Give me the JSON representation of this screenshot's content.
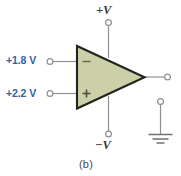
{
  "figure": {
    "caption": "(b)",
    "background_color": "#ffffff"
  },
  "colors": {
    "wire": "#8e9096",
    "outline": "#23231f",
    "amp_fill": "#ccd0a8",
    "input_label_blue": "#2f62a8",
    "supply_label": "#3a3a38",
    "caption": "#4a4a48",
    "terminal_stroke": "#8e9096"
  },
  "opamp": {
    "name": "operational-amplifier",
    "fill": "#ccd0a8",
    "inverting_symbol": "−",
    "noninverting_symbol": "+"
  },
  "inputs": [
    {
      "id": "inverting",
      "label": "+1.8 V",
      "value": "+1.8",
      "unit": "V",
      "terminal_symbol": "−",
      "terminal_name": "inverting-input"
    },
    {
      "id": "noninverting",
      "label": "+2.2 V",
      "value": "+2.2",
      "unit": "V",
      "terminal_symbol": "+",
      "terminal_name": "noninverting-input"
    }
  ],
  "supplies": [
    {
      "id": "positive",
      "label": "+V",
      "name": "positive-supply-terminal"
    },
    {
      "id": "negative",
      "label": "−V",
      "name": "negative-supply-terminal"
    }
  ],
  "output": {
    "name": "output-terminal",
    "label": ""
  },
  "ground": {
    "name": "ground-symbol",
    "label": ""
  }
}
